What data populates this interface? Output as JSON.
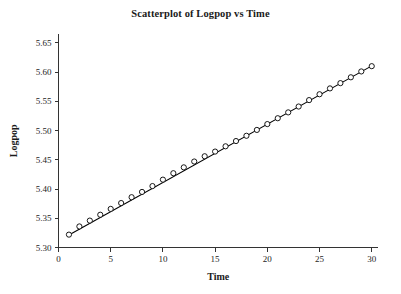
{
  "chart_data": {
    "type": "scatter",
    "title": "Scatterplot of Logpop vs Time",
    "xlabel": "Time",
    "ylabel": "Logpop",
    "xlim": [
      0,
      30.6
    ],
    "ylim": [
      5.3,
      5.665
    ],
    "grid": false,
    "legend": null,
    "xticks": [
      0,
      5,
      10,
      15,
      20,
      25,
      30
    ],
    "xtick_labels": [
      "0",
      "5",
      "10",
      "15",
      "20",
      "25",
      "30"
    ],
    "yticks": [
      5.3,
      5.35,
      5.4,
      5.45,
      5.5,
      5.55,
      5.6,
      5.65
    ],
    "ytick_labels": [
      "5.30",
      "5.35",
      "5.40",
      "5.45",
      "5.50",
      "5.55",
      "5.60",
      "5.65"
    ],
    "marker": "open-circle",
    "series": [
      {
        "name": "Logpop",
        "x": [
          1,
          2,
          3,
          4,
          5,
          6,
          7,
          8,
          9,
          10,
          11,
          12,
          13,
          14,
          15,
          16,
          17,
          18,
          19,
          20,
          21,
          22,
          23,
          24,
          25,
          26,
          27,
          28,
          29,
          30
        ],
        "values": [
          5.322,
          5.336,
          5.346,
          5.356,
          5.366,
          5.376,
          5.386,
          5.395,
          5.405,
          5.416,
          5.427,
          5.437,
          5.447,
          5.456,
          5.464,
          5.473,
          5.482,
          5.491,
          5.501,
          5.511,
          5.521,
          5.531,
          5.541,
          5.552,
          5.562,
          5.572,
          5.581,
          5.591,
          5.601,
          5.61
        ]
      }
    ],
    "fit_line": {
      "name": "linear-fit",
      "x_start": 1,
      "x_end": 30,
      "y_start": 5.3215,
      "y_end": 5.6105
    }
  }
}
